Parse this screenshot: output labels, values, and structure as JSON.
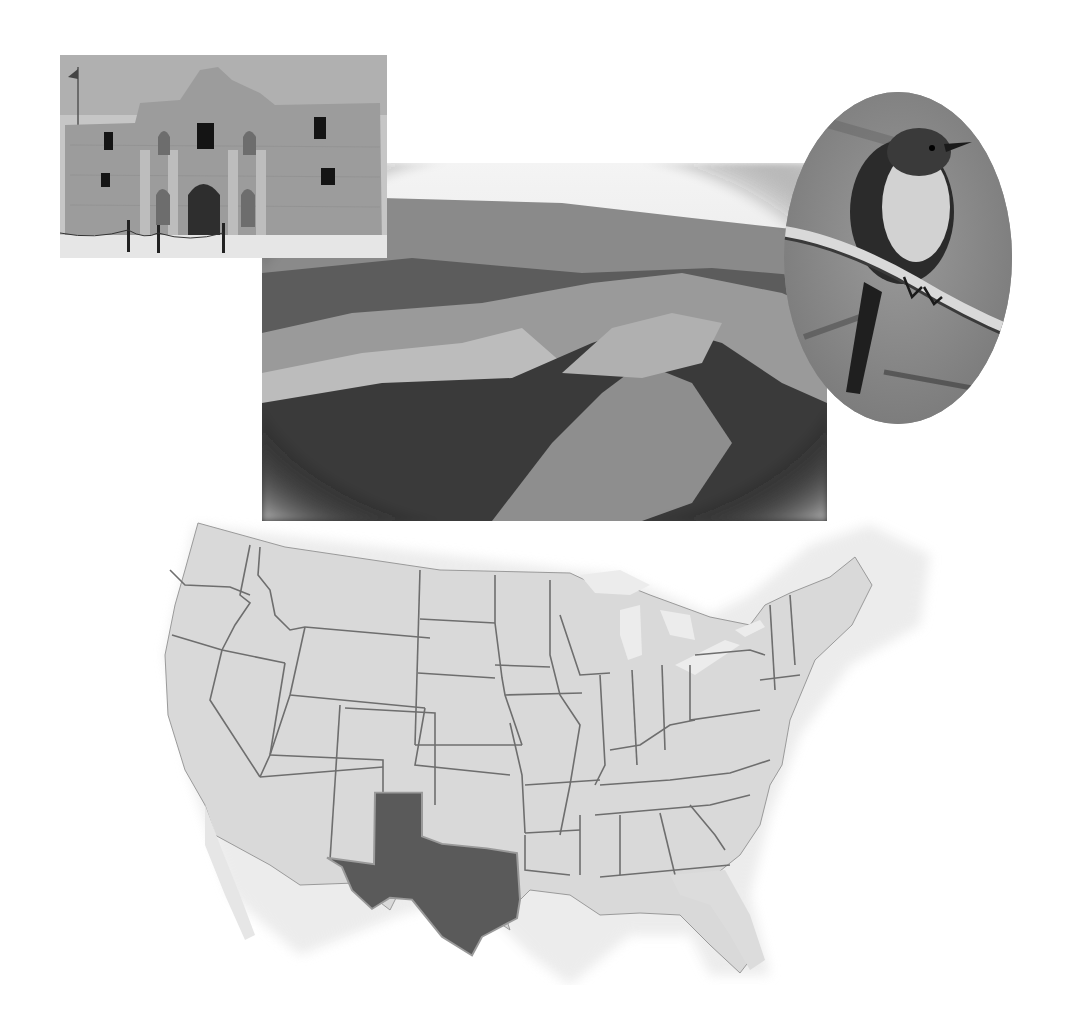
{
  "images": {
    "alamo": {
      "label": "The Alamo mission facade"
    },
    "canyon": {
      "label": "Rugged canyon landscape"
    },
    "bird": {
      "label": "Northern mockingbird perched on branch"
    }
  },
  "map": {
    "label": "Map of contiguous United States",
    "highlighted_state": "Texas",
    "colors": {
      "state_fill": "#d9d9d9",
      "state_border": "#6e6e6e",
      "highlight_fill": "#5a5a5a",
      "water": "#ececec"
    }
  }
}
